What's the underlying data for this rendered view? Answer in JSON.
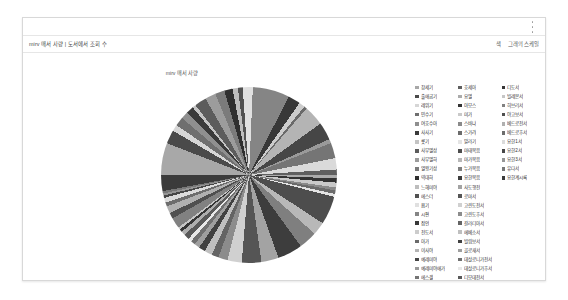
{
  "panel": {
    "title": "mirv 매서 사량 | 도서에서 조회 수",
    "menu_icon": "kebab-menu-icon",
    "right_links": [
      "색",
      "그래의 스케일"
    ]
  },
  "chart_data": {
    "type": "pie",
    "title": "mirv 매서 사량",
    "xlabel": "",
    "ylabel": "",
    "legend_position": "right",
    "grid": false,
    "palette": "grayscale",
    "categories": [
      "창세기",
      "출애굽기",
      "레위기",
      "민수기",
      "여호수아",
      "사사기",
      "룻기",
      "사무엘상",
      "사무엘하",
      "열왕기상",
      "역대하",
      "느헤미야",
      "에스더",
      "욥기",
      "시편",
      "잠언",
      "전도서",
      "아가",
      "이사야",
      "예레미야",
      "예레미야애가",
      "에스겔",
      "다니엘",
      "호세아",
      "요엘",
      "아모스",
      "미가",
      "스바냐",
      "스가랴",
      "말라기",
      "마태복음",
      "마가복음",
      "누가복음",
      "요한복음",
      "사도행전",
      "로마서",
      "고린도전서",
      "고린도후서",
      "갈라디아서",
      "에베소서",
      "빌립보서",
      "골로새서",
      "데살로니가전서",
      "데살로니가후서",
      "디모데전서",
      "디모데후서",
      "디도서",
      "빌레몬서",
      "히브리서",
      "야고보서",
      "베드로전서",
      "베드로후서",
      "요한1서",
      "요한2서",
      "요한3서",
      "유다서",
      "요한계시록"
    ],
    "values": [
      5.4,
      2.3,
      1.1,
      1.5,
      1.2,
      1.3,
      0.6,
      2.0,
      1.8,
      1.6,
      1.4,
      0.9,
      0.8,
      1.7,
      6.2,
      2.1,
      1.0,
      0.5,
      3.4,
      3.0,
      0.7,
      2.6,
      1.9,
      0.9,
      0.6,
      0.7,
      0.8,
      0.5,
      0.6,
      0.5,
      4.8,
      2.2,
      3.1,
      4.2,
      2.9,
      3.3,
      2.4,
      1.6,
      1.2,
      1.3,
      1.1,
      0.9,
      0.8,
      0.6,
      0.9,
      0.7,
      0.5,
      0.4,
      1.8,
      1.0,
      1.2,
      0.7,
      0.8,
      0.4,
      0.35,
      0.4,
      2.7
    ],
    "colors": [
      "#a8a8a8",
      "#4a4a4a",
      "#d6d6d6",
      "#6f6f6f",
      "#8f8f8f",
      "#3a3a3a",
      "#c4c4c4",
      "#5c5c5c",
      "#9c9c9c",
      "#7b7b7b",
      "#2f2f2f",
      "#bdbdbd",
      "#515151",
      "#e0e0e0",
      "#858585",
      "#383838",
      "#cccccc",
      "#6a6a6a",
      "#b4b4b4",
      "#464646",
      "#9a9a9a",
      "#757575",
      "#dadada",
      "#5f5f5f",
      "#ababab",
      "#333333",
      "#c9c9c9",
      "#8a8a8a",
      "#6b6b6b",
      "#e4e4e4",
      "#4d4d4d",
      "#b8b8b8",
      "#7f7f7f",
      "#3d3d3d",
      "#a3a3a3",
      "#555555",
      "#d0d0d0",
      "#8c8c8c",
      "#646464",
      "#bfbfbf",
      "#414141",
      "#9f9f9f",
      "#707070",
      "#e8e8e8",
      "#595959",
      "#aeaeae",
      "#363636",
      "#c6c6c6",
      "#818181",
      "#4f4f4f",
      "#b0b0b0",
      "#6d6d6d",
      "#dcdcdc",
      "#474747",
      "#969696",
      "#787878",
      "#3b3b3b"
    ]
  }
}
